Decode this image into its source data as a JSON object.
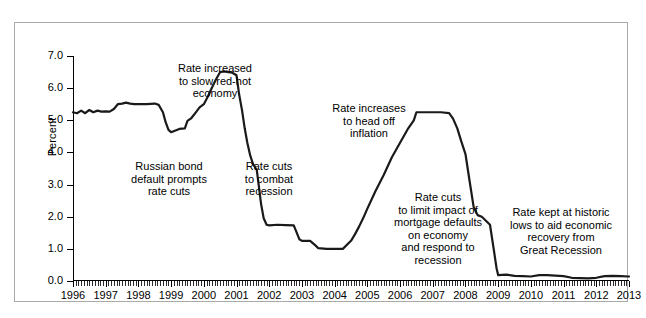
{
  "figure": {
    "top_sliver_text": "",
    "bottom_sliver_text": ""
  },
  "chart_data": {
    "type": "line",
    "title": "",
    "xlabel": "",
    "ylabel": "Percent",
    "xlim": [
      1996,
      2013
    ],
    "ylim": [
      0.0,
      7.0
    ],
    "grid": false,
    "legend_position": "none",
    "y_ticks": [
      "7.0",
      "6.0",
      "5.0",
      "4.0",
      "3.0",
      "2.0",
      "1.0",
      "0.0"
    ],
    "y_tick_values": [
      7.0,
      6.0,
      5.0,
      4.0,
      3.0,
      2.0,
      1.0,
      0.0
    ],
    "x_ticks": [
      "1996",
      "1997",
      "1998",
      "1999",
      "2000",
      "2001",
      "2002",
      "2003",
      "2004",
      "2005",
      "2006",
      "2007",
      "2008",
      "2009",
      "2010",
      "2011",
      "2012",
      "2013"
    ],
    "x_tick_values": [
      1996,
      1997,
      1998,
      1999,
      2000,
      2001,
      2002,
      2003,
      2004,
      2005,
      2006,
      2007,
      2008,
      2009,
      2010,
      2011,
      2012,
      2013
    ],
    "minor_ticks_per_year": 12,
    "line_color": "#1a1a1a",
    "line_width": 2.2,
    "series": [
      {
        "name": "Federal funds rate",
        "x": [
          1996.0,
          1996.12,
          1996.25,
          1996.37,
          1996.5,
          1996.62,
          1996.75,
          1996.87,
          1997.0,
          1997.12,
          1997.25,
          1997.37,
          1997.5,
          1997.62,
          1997.75,
          1997.87,
          1998.0,
          1998.25,
          1998.5,
          1998.62,
          1998.75,
          1998.83,
          1998.92,
          1999.0,
          1999.25,
          1999.42,
          1999.5,
          1999.62,
          1999.75,
          1999.87,
          2000.0,
          2000.12,
          2000.25,
          2000.37,
          2000.5,
          2000.62,
          2000.75,
          2000.87,
          2001.0,
          2001.08,
          2001.17,
          2001.25,
          2001.33,
          2001.42,
          2001.5,
          2001.62,
          2001.75,
          2001.83,
          2001.92,
          2002.0,
          2002.25,
          2002.5,
          2002.75,
          2002.92,
          2003.0,
          2003.25,
          2003.42,
          2003.5,
          2003.75,
          2004.0,
          2004.25,
          2004.5,
          2004.62,
          2004.75,
          2004.87,
          2005.0,
          2005.25,
          2005.5,
          2005.75,
          2006.0,
          2006.25,
          2006.42,
          2006.5,
          2006.75,
          2007.0,
          2007.25,
          2007.5,
          2007.62,
          2007.75,
          2007.87,
          2008.0,
          2008.12,
          2008.25,
          2008.37,
          2008.5,
          2008.75,
          2008.87,
          2008.95,
          2009.0,
          2009.25,
          2009.5,
          2009.75,
          2010.0,
          2010.25,
          2010.5,
          2010.75,
          2011.0,
          2011.25,
          2011.5,
          2011.75,
          2012.0,
          2012.25,
          2012.5,
          2012.75,
          2013.0
        ],
        "y": [
          5.25,
          5.22,
          5.3,
          5.22,
          5.32,
          5.25,
          5.3,
          5.27,
          5.28,
          5.27,
          5.35,
          5.5,
          5.52,
          5.55,
          5.52,
          5.5,
          5.5,
          5.5,
          5.52,
          5.48,
          5.25,
          4.95,
          4.7,
          4.63,
          4.73,
          4.75,
          4.98,
          5.07,
          5.24,
          5.4,
          5.5,
          5.73,
          6.02,
          6.27,
          6.5,
          6.52,
          6.5,
          6.48,
          6.4,
          5.8,
          5.3,
          4.75,
          4.3,
          3.9,
          3.65,
          3.45,
          2.4,
          1.95,
          1.75,
          1.73,
          1.75,
          1.74,
          1.73,
          1.3,
          1.25,
          1.25,
          1.1,
          1.02,
          1.0,
          1.0,
          1.0,
          1.25,
          1.45,
          1.7,
          1.95,
          2.25,
          2.8,
          3.3,
          3.85,
          4.3,
          4.75,
          5.0,
          5.25,
          5.25,
          5.25,
          5.25,
          5.22,
          5.05,
          4.75,
          4.35,
          3.95,
          3.15,
          2.3,
          2.05,
          2.0,
          1.75,
          0.95,
          0.4,
          0.18,
          0.2,
          0.16,
          0.15,
          0.14,
          0.18,
          0.18,
          0.17,
          0.15,
          0.1,
          0.09,
          0.08,
          0.1,
          0.15,
          0.16,
          0.15,
          0.14
        ]
      }
    ],
    "annotations": [
      {
        "id": "a0",
        "text": "Rate increased\nto slow red-hot\neconomy"
      },
      {
        "id": "a1",
        "text": "Russian bond\ndefault prompts\nrate cuts"
      },
      {
        "id": "a2",
        "text": "Rate cuts\nto combat\nrecession"
      },
      {
        "id": "a3",
        "text": "Rate increases\nto head off\ninflation"
      },
      {
        "id": "a4",
        "text": "Rate cuts\nto limit impact of\nmortgage defaults\non economy\nand respond to\nrecession"
      },
      {
        "id": "a5",
        "text": "Rate kept at historic\nlows to aid economic\nrecovery from\nGreat Recession"
      }
    ]
  }
}
